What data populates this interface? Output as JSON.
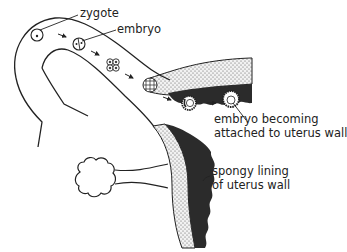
{
  "diagram": {
    "labels": {
      "zygote": "zygote",
      "embryo": "embryo",
      "attached_line1": "embryo becoming",
      "attached_line2": "attached to uterus wall",
      "spongy_line1": "spongy lining",
      "spongy_line2": "of uterus wall"
    },
    "stages": [
      {
        "name": "zygote",
        "description": "single cell with nucleus"
      },
      {
        "name": "two-cell embryo",
        "description": "divided cell"
      },
      {
        "name": "four-cell embryo",
        "description": "cluster of 4 cells"
      },
      {
        "name": "morula",
        "description": "ball of many cells"
      },
      {
        "name": "blastocyst",
        "description": "hollow ball of cells"
      },
      {
        "name": "implanting embryo",
        "description": "attaching to uterus wall"
      }
    ],
    "colors": {
      "line": "#222222",
      "stipple_fill": "#e6e6e6",
      "dark_lining": "#2b2b2b",
      "background": "#ffffff"
    }
  }
}
